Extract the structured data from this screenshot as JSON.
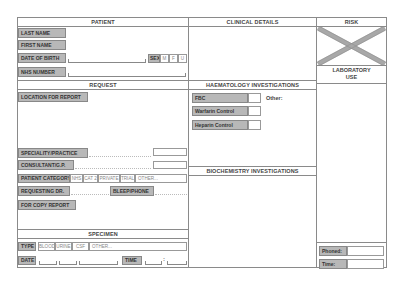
{
  "patient": {
    "header": "PATIENT",
    "last_name_label": "LAST NAME",
    "first_name_label": "FIRST NAME",
    "dob_label": "DATE OF BIRTH",
    "sex_label": "SEX",
    "sex_options": [
      "M",
      "F",
      "U"
    ],
    "nhs_label": "NHS NUMBER"
  },
  "clinical": {
    "header": "CLINICAL DETAILS"
  },
  "risk": {
    "header": "RISK",
    "lab_use_line1": "LABORATORY",
    "lab_use_line2": "USE",
    "phoned_label": "Phoned:",
    "time_label": "Time:"
  },
  "request": {
    "header": "REQUEST",
    "location_label": "LOCATION FOR REPORT",
    "speciality_label": "SPECIALITY/PRACTICE",
    "consultant_label": "CONSULTANT/G.P.",
    "patient_category_label": "PATIENT CATEGORY",
    "patient_category_options": [
      "NHS",
      "CAT 2",
      "PRIVATE",
      "TRIAL",
      "OTHER..."
    ],
    "requesting_label": "REQUESTING DR.",
    "bleep_label": "BLEEP/PHONE",
    "copy_report_label": "FOR COPY REPORT"
  },
  "haematology": {
    "header": "HAEMATOLOGY INVESTIGATIONS",
    "items": [
      "FBC",
      "Warfarin Control",
      "Heparin Control"
    ],
    "other_label": "Other:"
  },
  "biochemistry": {
    "header": "BIOCHEMISTRY INVESTIGATIONS"
  },
  "specimen": {
    "header": "SPECIMEN",
    "type_label": "TYPE",
    "type_options": [
      "BLOOD",
      "URINE",
      "CSF",
      "OTHER..."
    ],
    "date_label": "DATE",
    "time_label": "TIME",
    "date_sep": "/",
    "time_sep": ":"
  },
  "colors": {
    "label_fill": "#b8b8b8",
    "border": "#8a8a8a",
    "cross": "#a8a8a8"
  }
}
